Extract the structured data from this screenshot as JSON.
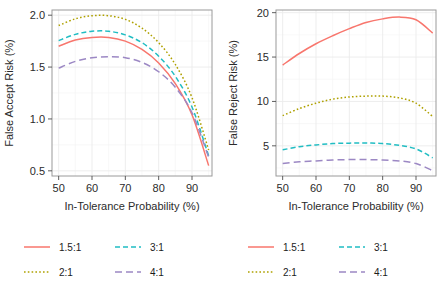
{
  "figure": {
    "background": "#ffffff",
    "panel_border_color": "#9a9a9a",
    "grid_color": "#ebebeb"
  },
  "series_styles": {
    "1.5:1": {
      "color": "#F8766D",
      "dash": "none",
      "width": 1.5
    },
    "2:1": {
      "color": "#AFA100",
      "dash": "1.6,2.2",
      "width": 1.5
    },
    "3:1": {
      "color": "#21BDC3",
      "dash": "5,3",
      "width": 1.5
    },
    "4:1": {
      "color": "#9C88C4",
      "dash": "7,4",
      "width": 1.5
    }
  },
  "legend": {
    "entries": [
      {
        "label": "1.5:1",
        "key": "1.5:1"
      },
      {
        "label": "3:1",
        "key": "3:1"
      },
      {
        "label": "2:1",
        "key": "2:1"
      },
      {
        "label": "4:1",
        "key": "4:1"
      }
    ]
  },
  "chart_data": [
    {
      "id": "false-accept-risk",
      "type": "line",
      "title": "",
      "xlabel": "In-Tolerance Probability (%)",
      "ylabel": "False Accept Risk (%)",
      "xlim": [
        48,
        96
      ],
      "ylim": [
        0.45,
        2.05
      ],
      "xticks": [
        50,
        60,
        70,
        80,
        90
      ],
      "yticks": [
        0.5,
        1.0,
        1.5,
        2.0
      ],
      "ytick_labels": [
        "0.5",
        "1.0",
        "1.5",
        "2.0"
      ],
      "xtick_labels": [
        "50",
        "60",
        "70",
        "80",
        "90"
      ],
      "grid": true,
      "legend_position": "bottom",
      "x": [
        50,
        55,
        60,
        65,
        70,
        75,
        80,
        85,
        90,
        95
      ],
      "series": [
        {
          "name": "1.5:1",
          "values": [
            1.7,
            1.76,
            1.785,
            1.785,
            1.75,
            1.67,
            1.54,
            1.34,
            1.04,
            0.55
          ]
        },
        {
          "name": "2:1",
          "values": [
            1.9,
            1.965,
            1.995,
            1.995,
            1.96,
            1.875,
            1.735,
            1.525,
            1.205,
            0.7
          ]
        },
        {
          "name": "3:1",
          "values": [
            1.755,
            1.815,
            1.845,
            1.845,
            1.81,
            1.735,
            1.605,
            1.41,
            1.115,
            0.645
          ]
        },
        {
          "name": "4:1",
          "values": [
            1.49,
            1.555,
            1.59,
            1.6,
            1.59,
            1.545,
            1.455,
            1.305,
            1.06,
            0.63
          ]
        }
      ]
    },
    {
      "id": "false-reject-risk",
      "type": "line",
      "title": "",
      "xlabel": "In-Tolerance Probability (%)",
      "ylabel": "False Reject Risk (%)",
      "xlim": [
        48,
        96
      ],
      "ylim": [
        1.6,
        20.3
      ],
      "xticks": [
        50,
        60,
        70,
        80,
        90
      ],
      "yticks": [
        5,
        10,
        15,
        20
      ],
      "ytick_labels": [
        "5",
        "10",
        "15",
        "20"
      ],
      "xtick_labels": [
        "50",
        "60",
        "70",
        "80",
        "90"
      ],
      "grid": true,
      "legend_position": "bottom",
      "x": [
        50,
        55,
        60,
        65,
        70,
        75,
        80,
        85,
        90,
        95
      ],
      "series": [
        {
          "name": "1.5:1",
          "values": [
            14.1,
            15.4,
            16.5,
            17.4,
            18.2,
            18.9,
            19.3,
            19.5,
            19.2,
            17.7
          ]
        },
        {
          "name": "2:1",
          "values": [
            8.4,
            9.2,
            9.8,
            10.25,
            10.5,
            10.6,
            10.6,
            10.4,
            9.8,
            8.3
          ]
        },
        {
          "name": "3:1",
          "values": [
            4.55,
            4.9,
            5.1,
            5.25,
            5.3,
            5.32,
            5.25,
            5.05,
            4.65,
            3.65
          ]
        },
        {
          "name": "4:1",
          "values": [
            3.0,
            3.2,
            3.3,
            3.4,
            3.45,
            3.45,
            3.4,
            3.3,
            3.0,
            2.2
          ]
        }
      ]
    }
  ]
}
